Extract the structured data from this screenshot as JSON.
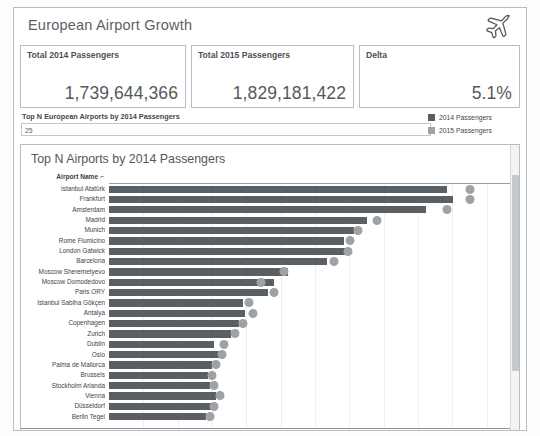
{
  "header": {
    "title": "European Airport Growth",
    "icon": "airplane-icon"
  },
  "kpis": [
    {
      "label": "Total 2014 Passengers",
      "value": "1,739,644,366"
    },
    {
      "label": "Total 2015 Passengers",
      "value": "1,829,181,422"
    },
    {
      "label": "Delta",
      "value": "5.1%"
    }
  ],
  "filter": {
    "label": "Top N European Airports by 2014 Passengers",
    "value": "25",
    "placeholder": ""
  },
  "legend": {
    "items": [
      {
        "label": "2014 Passengers",
        "color": "#5a5f64"
      },
      {
        "label": "2015 Passengers",
        "color": "#9ea2a7"
      }
    ]
  },
  "chart_panel": {
    "title": "Top N Airports by 2014 Passengers",
    "column_header": "Airport Name",
    "column_header_glyph": "⌐"
  },
  "chart_data": {
    "type": "bar",
    "title": "Top N Airports by 2014 Passengers",
    "xlabel": "",
    "ylabel": "Airport Name",
    "orientation": "horizontal",
    "grid": true,
    "legend_position": "top-right",
    "xlim": [
      0,
      100
    ],
    "categories": [
      "Istanbul Atatürk",
      "Frankfurt",
      "Amsterdam",
      "Madrid",
      "Munich",
      "Rome Fiumicino",
      "London Gatwick",
      "Barcelona",
      "Moscow Sheremetyevo",
      "Moscow Domodedovo",
      "Paris ORY",
      "Istanbul Sabiha Gökçen",
      "Antalya",
      "Copenhagen",
      "Zurich",
      "Dublin",
      "Oslo",
      "Palma de Mallorca",
      "Brussels",
      "Stockholm Arlanda",
      "Vienna",
      "Düsseldorf",
      "Berlin Tegel"
    ],
    "series": [
      {
        "name": "2014 Passengers",
        "values": [
          82.0,
          83.5,
          77.0,
          62.5,
          59.5,
          57.0,
          57.5,
          53.0,
          43.5,
          40.0,
          38.5,
          32.5,
          33.0,
          31.5,
          29.5,
          25.5,
          27.0,
          25.0,
          24.0,
          24.5,
          26.0,
          25.5,
          23.5
        ]
      },
      {
        "name": "2015 Passengers",
        "values": [
          87.5,
          87.5,
          82.0,
          65.0,
          60.5,
          58.5,
          58.0,
          54.5,
          42.5,
          37.0,
          40.0,
          34.0,
          35.0,
          32.5,
          30.5,
          28.0,
          27.5,
          26.0,
          25.0,
          25.5,
          27.0,
          25.5,
          24.5
        ]
      }
    ]
  }
}
